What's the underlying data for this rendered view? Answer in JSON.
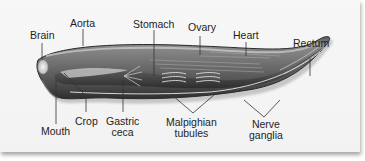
{
  "diagram": {
    "colors": {
      "background": "#f4f4f4",
      "body_dark": "#3a3a3a",
      "body_mid": "#8a8a8a",
      "body_light": "#d8d8d8",
      "leader_line": "#333333",
      "label_text": "#1e1e1e"
    },
    "labels": {
      "brain": "Brain",
      "aorta": "Aorta",
      "stomach": "Stomach",
      "ovary": "Ovary",
      "heart": "Heart",
      "rectum": "Rectum",
      "mouth": "Mouth",
      "crop": "Crop",
      "gastric_ceca_line1": "Gastric",
      "gastric_ceca_line2": "ceca",
      "malpighian_tubules_line1": "Malpighian",
      "malpighian_tubules_line2": "tubules",
      "nerve_ganglia_line1": "Nerve",
      "nerve_ganglia_line2": "ganglia"
    }
  }
}
